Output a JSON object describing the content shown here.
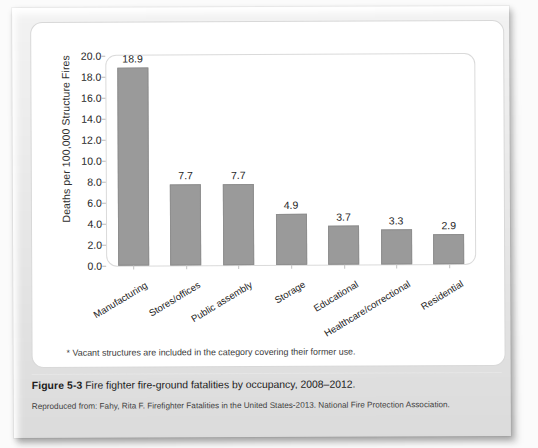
{
  "figure": {
    "caption_label": "Figure 5-3",
    "caption_text": "Fire fighter fire-ground fatalities by occupancy, 2008–2012.",
    "credit": "Reproduced from: Fahy, Rita F. Firefighter Fatalities in the United States-2013. National Fire Protection Association.",
    "footnote": "* Vacant structures are included in the category covering their former use."
  },
  "chart_data": {
    "type": "bar",
    "title": "",
    "xlabel": "",
    "ylabel": "Deaths per 100,000 Structure Fires",
    "categories": [
      "Manufacturing",
      "Stores/offices",
      "Public assembly",
      "Storage",
      "Educational",
      "Healthcare/correctional",
      "Residential"
    ],
    "values": [
      18.9,
      7.7,
      7.7,
      4.9,
      3.7,
      3.3,
      2.9
    ],
    "value_labels": [
      "18.9",
      "7.7",
      "7.7",
      "4.9",
      "3.7",
      "3.3",
      "2.9"
    ],
    "ylim": [
      0.0,
      20.0
    ],
    "ytick_step": 2.0,
    "ytick_labels": [
      "20.0",
      "18.0",
      "16.0",
      "14.0",
      "12.0",
      "10.0",
      "8.0",
      "6.0",
      "4.0",
      "2.0",
      "0.0"
    ],
    "grid": false,
    "legend": false,
    "bar_color": "#9a9a9a"
  }
}
